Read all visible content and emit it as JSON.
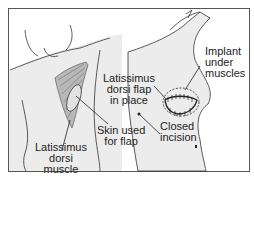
{
  "figure": {
    "panels": [
      {
        "name": "back-view",
        "description": "Back view showing the latissimus dorsi muscle and skin used for the flap"
      },
      {
        "name": "front-view",
        "description": "Side/front view showing the flap in place with implant and closed incision"
      }
    ],
    "labels": {
      "latissimus_muscle": [
        "Latissimus",
        "dorsi",
        "muscle"
      ],
      "skin_used": [
        "Skin used",
        "for flap"
      ],
      "flap_in_place": [
        "Latissimus",
        "dorsi flap",
        "in place"
      ],
      "implant": [
        "Implant",
        "under",
        "muscles"
      ],
      "closed_incision": [
        "Closed",
        "incision"
      ]
    },
    "colors": {
      "skin": "#ececec",
      "muscle": "#8a8a8a",
      "outline": "#333333",
      "frame": "#555555"
    }
  }
}
